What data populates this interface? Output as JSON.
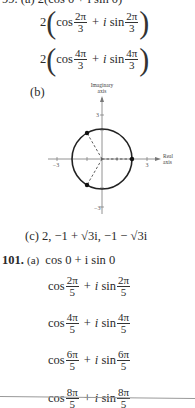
{
  "top_partial": "99. (a) 2(cos 0 + i sin 0)",
  "part_a_cont": [
    {
      "coef": "2",
      "cos": "cos",
      "plus": "+",
      "i": "i",
      "sin": "sin",
      "num": "2π",
      "den": "3"
    },
    {
      "coef": "2",
      "cos": "cos",
      "plus": "+",
      "i": "i",
      "sin": "sin",
      "num": "4π",
      "den": "3"
    }
  ],
  "part_b": {
    "label": "(b)",
    "ylabel_1": "Imaginary",
    "ylabel_2": "axis",
    "xlabel_1": "Real",
    "xlabel_2": "axis",
    "tick_pos": "3",
    "tick_neg": "−3",
    "ytick_pos": "3",
    "ytick_neg": "−3"
  },
  "part_c": {
    "label": "(c)",
    "text": "2, −1 + √3i, −1 − √3i"
  },
  "problem_101": {
    "number": "101.",
    "part_label": "(a)",
    "first": "cos 0 + i sin 0",
    "roots": [
      {
        "cos": "cos",
        "plus": "+",
        "i": "i",
        "sin": "sin",
        "num": "2π",
        "den": "5"
      },
      {
        "cos": "cos",
        "plus": "+",
        "i": "i",
        "sin": "sin",
        "num": "4π",
        "den": "5"
      },
      {
        "cos": "cos",
        "plus": "+",
        "i": "i",
        "sin": "sin",
        "num": "6π",
        "den": "5"
      },
      {
        "cos": "cos",
        "plus": "+",
        "i": "i",
        "sin": "sin",
        "num": "8π",
        "den": "5"
      }
    ]
  }
}
